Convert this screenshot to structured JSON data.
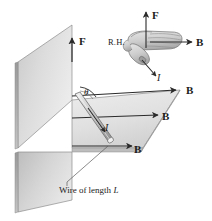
{
  "figure": {
    "background_color": "#ffffff",
    "ink_color": "#1b1b1b",
    "plane_fill_light": "#e3e3e3",
    "plane_fill_mid": "#cfcfcf",
    "plane_fill_dark": "#b6b6b6",
    "wire_fill": "#d6d6d6"
  },
  "main_diagram": {
    "force_label": "F",
    "current_label": "I",
    "angle_label": "θ",
    "field_labels": [
      {
        "id": "b-top",
        "text": "B"
      },
      {
        "id": "b-middle",
        "text": "B"
      },
      {
        "id": "b-bottom",
        "text": "B"
      }
    ],
    "caption": {
      "prefix": "Wire of length ",
      "symbol": "L"
    }
  },
  "inset": {
    "name": "right-hand-rule",
    "hand_label": "R.H.",
    "force_label": "F",
    "field_label": "B",
    "current_label": "I"
  }
}
